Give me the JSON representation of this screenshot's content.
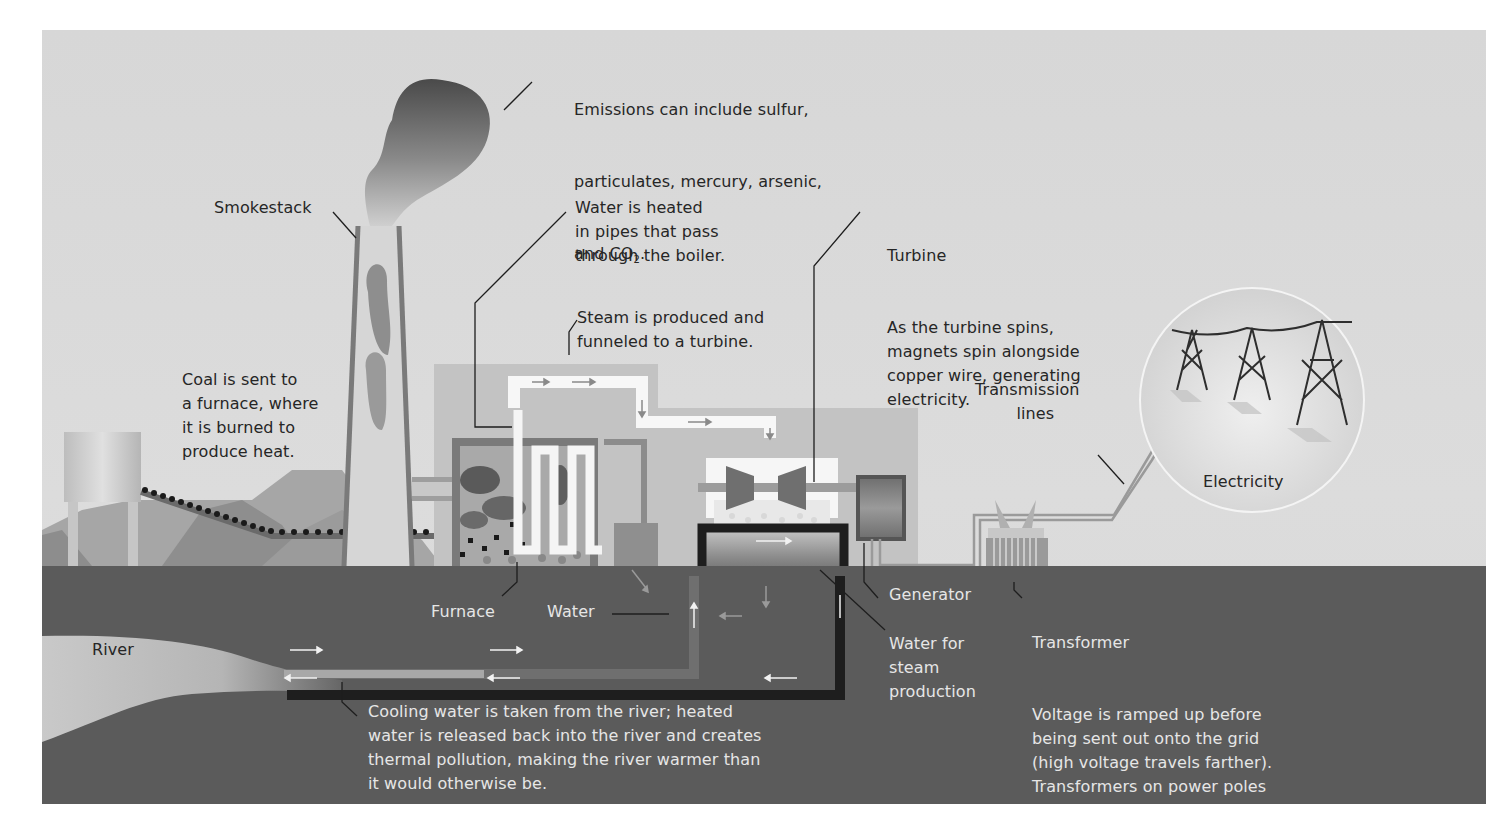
{
  "diagram": {
    "colors": {
      "sky": "#d9d9d9",
      "ground": "#5a5a5a",
      "building": "#c4c4c4",
      "building_dark": "#8a8a8a",
      "pipe_white": "#f7f7f7",
      "cooling_pipe": "#1e1e1e",
      "river": "#c8c8c8",
      "text_dark": "#262626",
      "text_light": "#e6e6e6"
    },
    "labels": {
      "emissions": {
        "line1": "Emissions can include sulfur,",
        "line2": "particulates, mercury, arsenic,",
        "line3_prefix": "and CO",
        "line3_sub": "2",
        "line3_suffix": "."
      },
      "smokestack": "Smokestack",
      "water_heated": "Water is heated\nin pipes that pass\nthrough the boiler.",
      "steam": "Steam is produced and\nfunneled to a turbine.",
      "turbine_title": "Turbine",
      "turbine_body": "As the turbine spins,\nmagnets spin alongside\ncopper wire, generating\nelectricity.",
      "coal": "Coal is sent to\na furnace, where\nit is burned to\nproduce heat.",
      "transmission": "Transmission\n        lines",
      "electricity": "Electricity",
      "furnace": "Furnace",
      "water": "Water",
      "generator": "Generator",
      "water_steam": "Water for\nsteam\nproduction",
      "river": "River",
      "transformer_title": "Transformer",
      "transformer_body": "Voltage is ramped up before\nbeing sent out onto the grid\n(high voltage travels farther).\nTransformers on power poles\nstep voltage down before it\nenters your home.",
      "cooling": "Cooling water is taken from the river; heated\nwater is released back into the river and creates\nthermal pollution, making the river warmer than\nit would otherwise be."
    }
  }
}
